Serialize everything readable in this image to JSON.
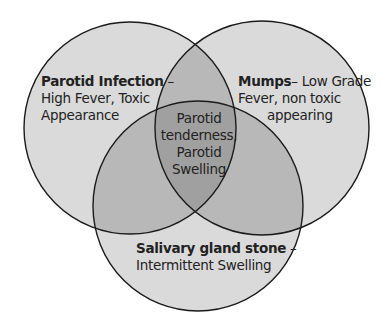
{
  "diagram": {
    "type": "venn",
    "colors": {
      "single": "#dadada",
      "double": "#b8b8b8",
      "triple": "#a0a0a0",
      "stroke": "#1a1a1a"
    },
    "sets": [
      {
        "id": "parotid-infection",
        "title": "Parotid Infection",
        "separator": " –",
        "line1": "High Fever, Toxic",
        "line2": "Appearance"
      },
      {
        "id": "mumps",
        "title": "Mumps",
        "separator": "– ",
        "line1_rest": "Low Grade",
        "line2": "Fever, non toxic",
        "line3": "appearing"
      },
      {
        "id": "salivary-gland-stone",
        "title": "Salivary gland stone",
        "separator": " –",
        "line1": "Intermittent Swelling"
      }
    ],
    "intersection": {
      "line1": "Parotid",
      "line2": "tenderness,",
      "line3": "Parotid",
      "line4": "Swelling"
    }
  }
}
